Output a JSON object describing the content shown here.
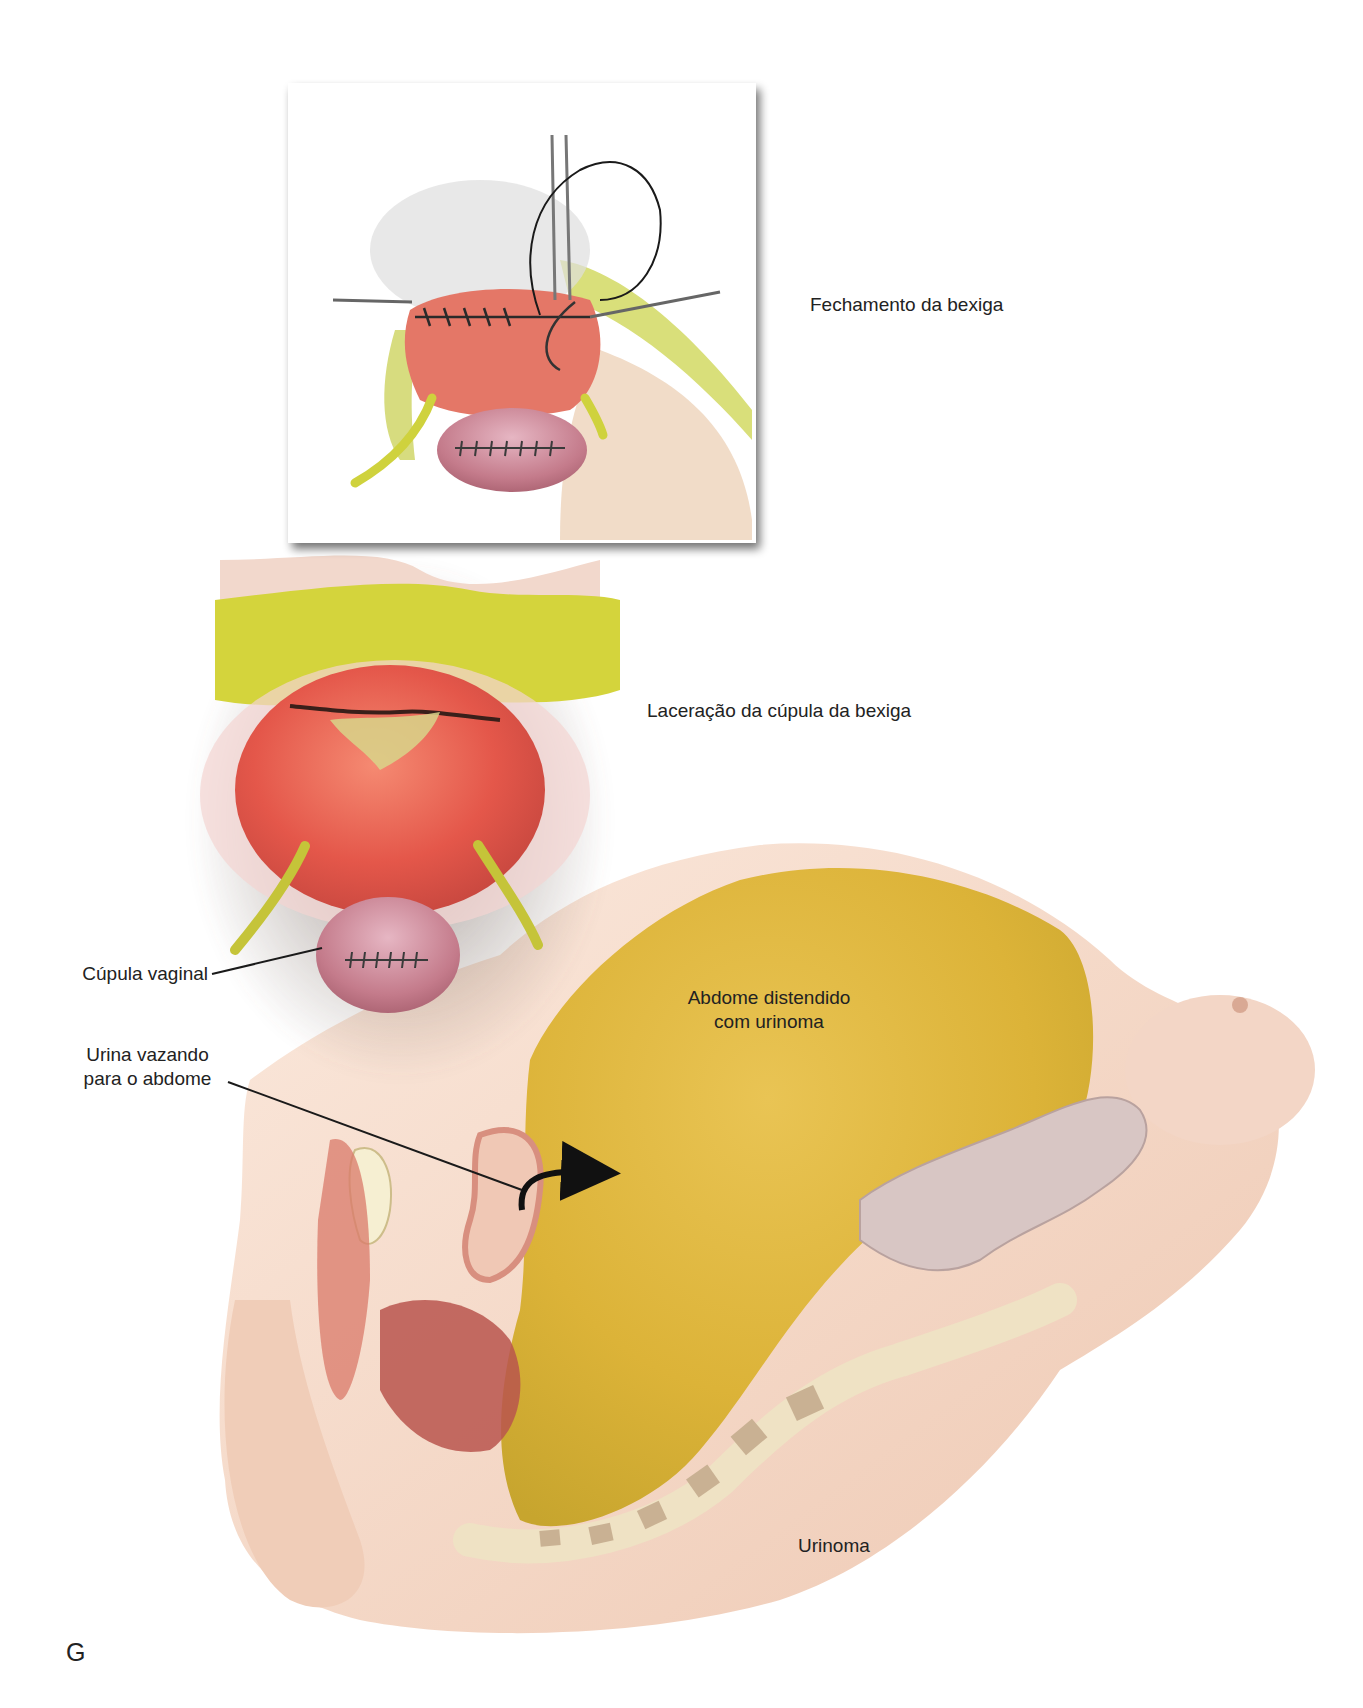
{
  "figure": {
    "panel_letter": "G",
    "labels": {
      "bladder_closure": "Fechamento da bexiga",
      "bladder_dome_laceration": "Laceração da cúpula da bexiga",
      "vaginal_cuff": "Cúpula vaginal",
      "distended_abdomen_line1": "Abdome distendido",
      "distended_abdomen_line2": "com urinoma",
      "urine_leak_line1": "Urina vazando",
      "urine_leak_line2": "para o abdome",
      "urinoma": "Urinoma"
    },
    "panels": [
      {
        "id": "inset-bladder-closure",
        "caption_ref": "bladder_closure"
      },
      {
        "id": "bladder-dome-laceration",
        "caption_ref": "bladder_dome_laceration"
      },
      {
        "id": "sagittal-urinoma",
        "caption_ref": "urinoma"
      }
    ],
    "colors": {
      "skin": "#f6dccb",
      "skin_shadow": "#e8bfa6",
      "bladder_red": "#e9614f",
      "vaginal_cuff_pink": "#c9808f",
      "fat_yellow": "#d8d640",
      "ureter_yellow": "#c9c93c",
      "urinoma_yellow": "#e1b93d",
      "leader_line": "#1a1a1a",
      "arrow": "#111111",
      "inset_frame_shadow": "#9a9a9a"
    }
  }
}
